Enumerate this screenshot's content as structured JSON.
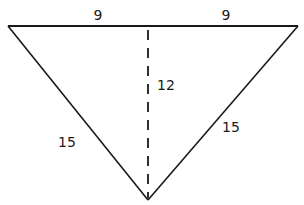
{
  "diagram": {
    "type": "isosceles-triangle",
    "stroke_color": "#1a1a1a",
    "background": "#ffffff",
    "vertices": {
      "top_left": [
        8,
        26
      ],
      "top_right": [
        298,
        26
      ],
      "bottom": [
        148,
        200
      ]
    },
    "altitude": {
      "from": [
        148,
        28
      ],
      "to": [
        148,
        198
      ],
      "style": "dashed"
    },
    "labels": {
      "top_left_half": "9",
      "top_right_half": "9",
      "altitude": "12",
      "left_side": "15",
      "right_side": "15"
    }
  }
}
